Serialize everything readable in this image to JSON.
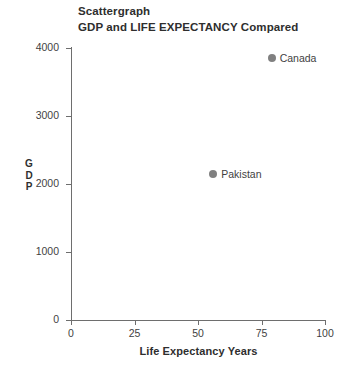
{
  "chart_data": {
    "type": "scatter",
    "title": "Scattergraph",
    "subtitle": "GDP and LIFE EXPECTANCY Compared",
    "xlabel": "Life Expectancy Years",
    "ylabel": "GDP",
    "ylabel_stacked": [
      "G",
      "D",
      "P"
    ],
    "xlim": [
      0,
      100
    ],
    "ylim": [
      0,
      4000
    ],
    "xticks": [
      0,
      25,
      50,
      75,
      100
    ],
    "yticks": [
      0,
      1000,
      2000,
      3000,
      4000
    ],
    "xtick_labels": [
      "0",
      "25",
      "50",
      "75",
      "100"
    ],
    "ytick_labels": [
      "0",
      "1000",
      "2000",
      "3000",
      "4000"
    ],
    "grid": false,
    "legend": "none",
    "marker_color": "#808080",
    "axis_color": "#6e6e6e",
    "points": [
      {
        "label": "Canada",
        "x": 79,
        "y": 3850
      },
      {
        "label": "Pakistan",
        "x": 56,
        "y": 2150
      }
    ]
  }
}
